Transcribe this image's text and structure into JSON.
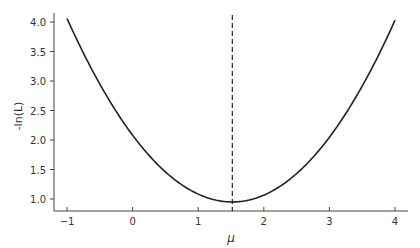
{
  "chart_data": {
    "type": "line",
    "title": "",
    "xlabel": "μ",
    "ylabel": "-ln(L)",
    "xlim": [
      -1.2,
      4.2
    ],
    "ylim": [
      0.78,
      4.15
    ],
    "xticks": [
      -1,
      0,
      1,
      2,
      3,
      4
    ],
    "xtick_labels": [
      "−1",
      "0",
      "1",
      "2",
      "3",
      "4"
    ],
    "yticks": [
      1.0,
      1.5,
      2.0,
      2.5,
      3.0,
      3.5,
      4.0
    ],
    "ytick_labels": [
      "1.0",
      "1.5",
      "2.0",
      "2.5",
      "3.0",
      "3.5",
      "4.0"
    ],
    "grid": false,
    "series": [
      {
        "name": "-ln(L)",
        "style": "solid",
        "x": [
          -1.0,
          -0.5,
          0.0,
          0.5,
          1.0,
          1.52,
          2.0,
          2.5,
          3.0,
          3.5,
          4.0
        ],
        "y": [
          4.06,
          2.97,
          2.08,
          1.46,
          1.08,
          0.95,
          1.06,
          1.42,
          2.02,
          2.87,
          4.03
        ]
      }
    ],
    "vline": {
      "x": 1.52,
      "style": "dashed",
      "label": "minimum"
    }
  }
}
